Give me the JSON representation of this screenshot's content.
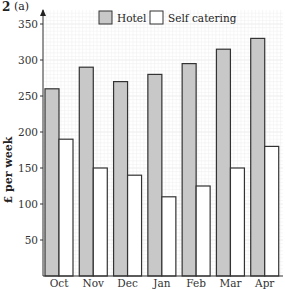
{
  "question": {
    "number": "2",
    "part": "(a)"
  },
  "chart_data": {
    "type": "bar",
    "title": "",
    "xlabel": "",
    "ylabel": "£ per week",
    "categories": [
      "Oct",
      "Nov",
      "Dec",
      "Jan",
      "Feb",
      "Mar",
      "Apr"
    ],
    "series": [
      {
        "name": "Hotel",
        "color": "#c8c8c8",
        "values": [
          260,
          290,
          270,
          280,
          295,
          315,
          330
        ]
      },
      {
        "name": "Self catering",
        "color": "#ffffff",
        "values": [
          190,
          150,
          140,
          110,
          125,
          150,
          180
        ]
      }
    ],
    "yticks": [
      50,
      100,
      150,
      200,
      250,
      300,
      350
    ],
    "ylim": [
      0,
      350
    ],
    "grid": true,
    "legend_position": "top"
  }
}
